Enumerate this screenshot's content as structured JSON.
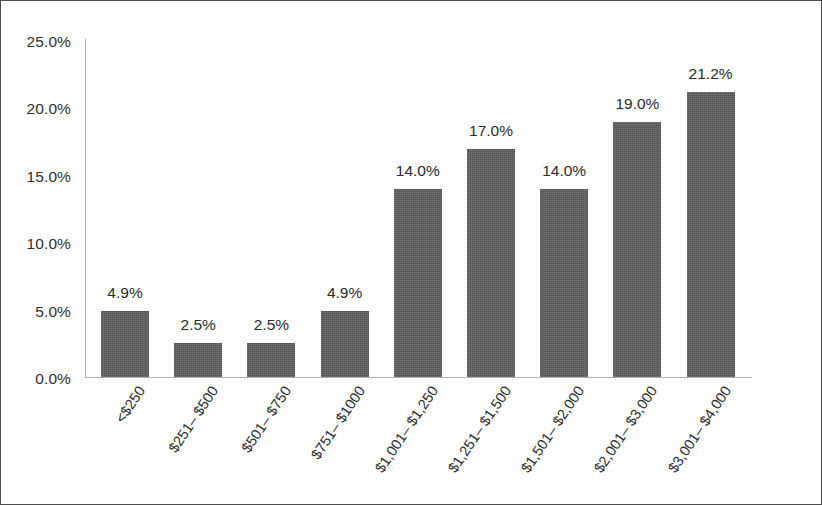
{
  "chart_data": {
    "type": "bar",
    "title": "",
    "xlabel": "",
    "ylabel": "",
    "categories": [
      "<$250",
      "$251– $500",
      "$501– $750",
      "$751– $1000",
      "$1,001– $1,250",
      "$1,251– $1,500",
      "$1,501– $2,000",
      "$2,001– $3,000",
      "$3,001– $4,000"
    ],
    "values": [
      4.9,
      2.5,
      2.5,
      4.9,
      14.0,
      17.0,
      14.0,
      19.0,
      21.2
    ],
    "data_labels": [
      "4.9%",
      "2.5%",
      "2.5%",
      "4.9%",
      "14.0%",
      "17.0%",
      "14.0%",
      "19.0%",
      "21.2%"
    ],
    "ytick_labels": [
      "25.0%",
      "20.0%",
      "15.0%",
      "10.0%",
      "5.0%",
      "0.0%"
    ],
    "ytick_values": [
      25.0,
      20.0,
      15.0,
      10.0,
      5.0,
      0.0
    ],
    "ylim": [
      0,
      25
    ],
    "grid": false,
    "legend": false,
    "bar_color": "#5e5e5e",
    "axis_color": "#b0b0b0",
    "text_color": "#2b2b2b",
    "frame_color": "#4d4d4d",
    "background": "#ffffff"
  }
}
